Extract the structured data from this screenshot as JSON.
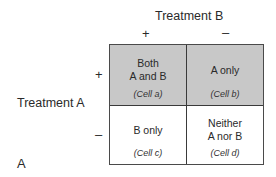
{
  "diagram": {
    "panel_label": "A",
    "column_header": "Treatment B",
    "row_header": "Treatment A",
    "column_signs": [
      "+",
      "–"
    ],
    "row_signs": [
      "+",
      "–"
    ],
    "colors": {
      "shaded": "#c8c8c8",
      "unshaded": "#ffffff",
      "border": "#3a3a3a"
    },
    "cells": [
      {
        "id": "a",
        "line1": "Both",
        "line2": "A and B",
        "tag": "(Cell a)",
        "shaded": true
      },
      {
        "id": "b",
        "line1": "A only",
        "line2": "",
        "tag": "(Cell b)",
        "shaded": true
      },
      {
        "id": "c",
        "line1": "B only",
        "line2": "",
        "tag": "(Cell c)",
        "shaded": false
      },
      {
        "id": "d",
        "line1": "Neither",
        "line2": "A nor B",
        "tag": "(Cell d)",
        "shaded": false
      }
    ]
  }
}
